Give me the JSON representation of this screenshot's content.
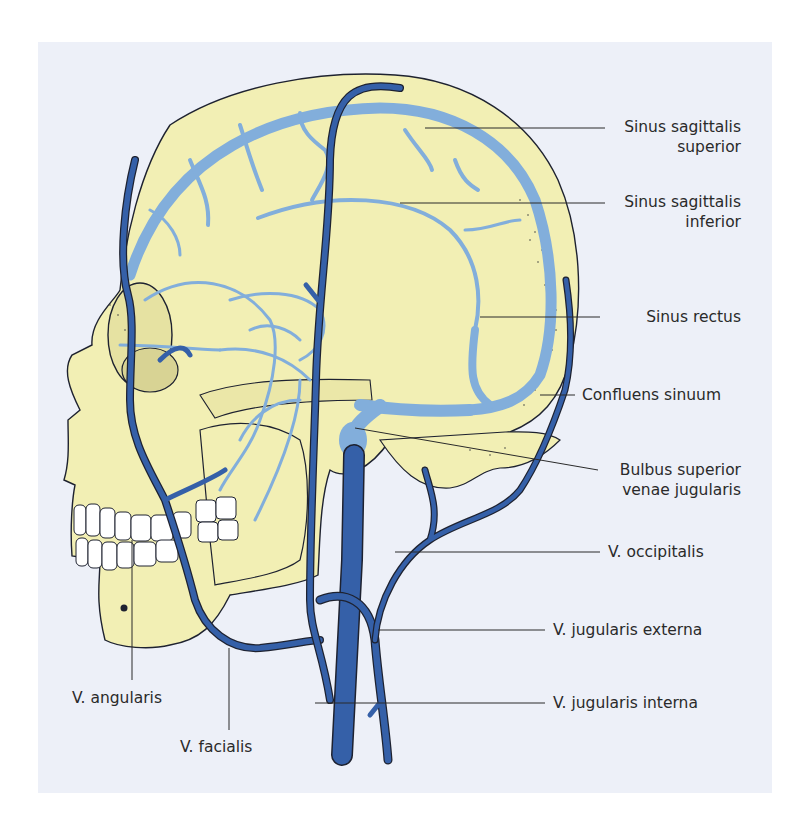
{
  "figure": {
    "colors": {
      "background": "#edf0f8",
      "skull": "#f2efb4",
      "dural_sinuses": "#82aedb",
      "veins": "#3560a8",
      "outline": "#1e2230",
      "teeth": "#ffffff"
    }
  },
  "labels": {
    "sinus_sagittalis_superior": [
      "Sinus sagittalis",
      "superior"
    ],
    "sinus_sagittalis_inferior": [
      "Sinus sagittalis",
      "inferior"
    ],
    "sinus_rectus": "Sinus rectus",
    "confluens_sinuum": "Confluens sinuum",
    "bulbus_superior": [
      "Bulbus superior",
      "venae jugularis"
    ],
    "v_occipitalis": "V. occipitalis",
    "v_jugularis_externa": "V. jugularis externa",
    "v_jugularis_interna": "V. jugularis interna",
    "v_angularis": "V. angularis",
    "v_facialis": "V. facialis"
  }
}
